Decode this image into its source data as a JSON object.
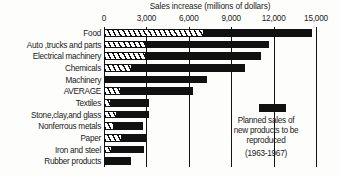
{
  "chart_data": {
    "type": "bar",
    "orientation": "horizontal",
    "stacked": true,
    "title": "Sales increase (millions of dollars)",
    "xlabel": "Sales increase (millions of dollars)",
    "ylabel": "",
    "xlim": [
      0,
      15000
    ],
    "xticks": [
      0,
      3000,
      6000,
      9000,
      12000,
      15000
    ],
    "xtick_labels": [
      "0",
      "3,000",
      "6,000",
      "9,000",
      "12,000",
      "15,000"
    ],
    "grid": true,
    "legend_position": "inside-lower-right",
    "categories": [
      "Food",
      "Auto ,trucks and parts",
      "Electrical machinery",
      "Chemicals",
      "Machinery",
      "AVERAGE",
      "Textiles",
      "Stone,clay,and glass",
      "Nonferrous metals",
      "Paper",
      "Iron and steel",
      "Rubber products"
    ],
    "series": [
      {
        "name": "Planned sales of new products to be reproduced (1963-1967)",
        "fill": "hatched",
        "values": [
          7100,
          3000,
          2950,
          2000,
          0,
          1200,
          500,
          900,
          700,
          1250,
          550,
          0
        ]
      },
      {
        "name": "Other sales increase",
        "fill": "solid",
        "values": [
          7600,
          8700,
          8150,
          8000,
          7300,
          5100,
          2650,
          2250,
          2050,
          1750,
          2250,
          1900
        ]
      }
    ],
    "totals": [
      14700,
      11700,
      11100,
      10000,
      7300,
      6300,
      3150,
      3150,
      2750,
      3000,
      2800,
      1900
    ],
    "legend": {
      "swatch_color": "#111111",
      "lines": [
        "Planned sales of",
        "new products to be",
        "reproduced"
      ],
      "years": "(1963-1967)"
    },
    "colors": {
      "solid": "#111111",
      "hatch_stroke": "#111111",
      "hatch_background": "#ffffff",
      "axis": "#141414",
      "text": "#1a1a1a",
      "background": "#fdfdfb"
    }
  }
}
